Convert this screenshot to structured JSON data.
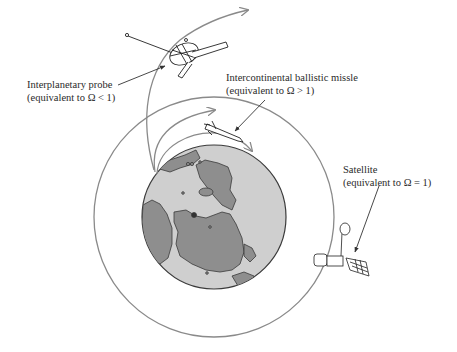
{
  "diagram": {
    "colors": {
      "ocean": "#cfcfcf",
      "land": "#8e8e8e",
      "outline": "#3a3a3a",
      "trajectory": "#8a8a8a",
      "text": "#2a2a2a",
      "background": "#ffffff"
    },
    "labels": {
      "probe": {
        "line1": "Interplanetary probe",
        "line2": "(equivalent to Ω < 1)"
      },
      "missile": {
        "line1": "Intercontinental ballistic missle",
        "line2": "(equivalent to Ω > 1)"
      },
      "satellite": {
        "line1": "Satellite",
        "line2": "(equivalent to Ω = 1)"
      }
    },
    "objects": [
      {
        "name": "earth",
        "shape": "circle"
      },
      {
        "name": "satellite-orbit",
        "shape": "circle"
      },
      {
        "name": "interplanetary-probe",
        "trajectory": "escape"
      },
      {
        "name": "ballistic-missile",
        "trajectory": "suborbital"
      },
      {
        "name": "satellite",
        "trajectory": "circular-orbit"
      }
    ]
  }
}
